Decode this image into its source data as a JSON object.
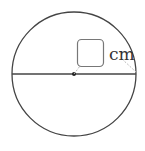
{
  "figure": {
    "type": "circle-diameter",
    "answer_box": "",
    "unit_label": "cm",
    "colors": {
      "stroke": "#444444",
      "leader": "#bbbbbb",
      "box_border": "#777777"
    }
  }
}
